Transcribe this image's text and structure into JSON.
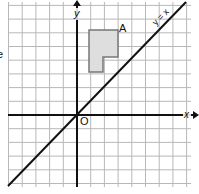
{
  "diagram": {
    "type": "coordinate-grid",
    "grid": {
      "color": "#b8b8b8",
      "cell_px": 13.7,
      "left": 8,
      "right": 191,
      "top": 2,
      "bottom": 187
    },
    "axes": {
      "x_label": "x",
      "y_label": "y",
      "origin_label": "O",
      "color": "#111111"
    },
    "line": {
      "label": "y = x",
      "color": "#111111"
    },
    "shape": {
      "label": "A",
      "fill": "#dedede",
      "stroke": "#777777",
      "cells": [
        [
          1,
          6
        ],
        [
          2,
          6
        ],
        [
          1,
          5
        ],
        [
          2,
          5
        ],
        [
          1,
          4
        ]
      ]
    },
    "margin_text": "e"
  }
}
